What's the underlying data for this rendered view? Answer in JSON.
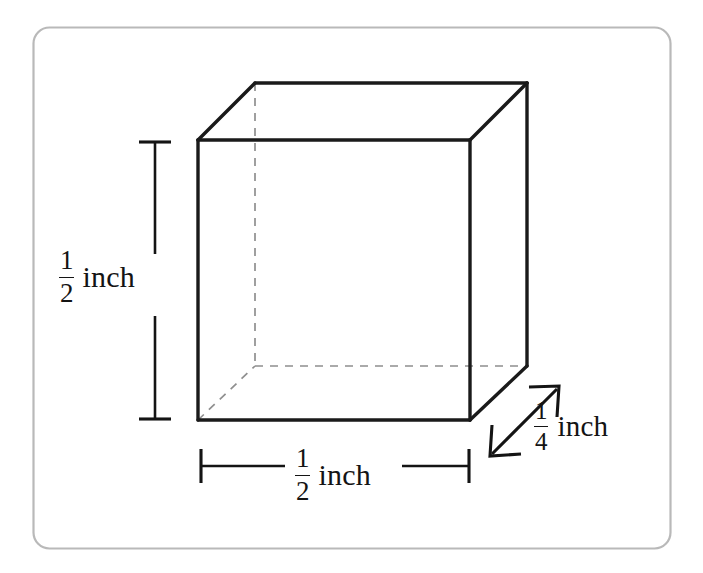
{
  "figure": {
    "kind": "geometry-diagram",
    "background_color": "#ffffff",
    "card": {
      "name": "figure-card",
      "border_color": "#b8b8b8",
      "fill_color": "#ffffff",
      "x": 33,
      "y": 27,
      "width": 637,
      "height": 521,
      "corner_radius": 16
    },
    "solid": {
      "name": "rectangular-prism",
      "stroke_color": "#1a1a1a",
      "hidden_stroke_color": "#8a8a8a",
      "visible_edge_width": 3.2,
      "hidden_edge_width": 1.6,
      "hidden_dash": "7 6",
      "front_face": {
        "left": 198,
        "right": 470,
        "top": 140,
        "bottom": 420
      },
      "depth_offset": {
        "dx": 57,
        "dy": -58
      }
    },
    "dimensions": [
      {
        "name": "height-dimension",
        "position": "left",
        "orientation": "vertical",
        "line_x": 155,
        "y_top": 141,
        "y_bottom": 420,
        "tick_half_width": 16,
        "value_numerator": "1",
        "value_denominator": "2",
        "unit": "inch",
        "label": "1/2 inch"
      },
      {
        "name": "width-dimension",
        "position": "bottom",
        "orientation": "horizontal",
        "line_y": 466,
        "x_left": 200,
        "x_right": 470,
        "tick_half_height": 17,
        "value_numerator": "1",
        "value_denominator": "2",
        "unit": "inch",
        "label": "1/2 inch"
      },
      {
        "name": "depth-dimension",
        "position": "lower-right",
        "orientation": "diagonal",
        "x_start": 489,
        "y_start": 456,
        "x_end": 560,
        "y_end": 385,
        "arrowhead": "open-v-both-ends",
        "value_numerator": "1",
        "value_denominator": "4",
        "unit": "inch",
        "label": "1/4 inch"
      }
    ]
  },
  "labels": {
    "height": {
      "numerator": "1",
      "denominator": "2",
      "unit": "inch"
    },
    "width": {
      "numerator": "1",
      "denominator": "2",
      "unit": "inch"
    },
    "depth": {
      "numerator": "1",
      "denominator": "4",
      "unit": "inch"
    }
  }
}
